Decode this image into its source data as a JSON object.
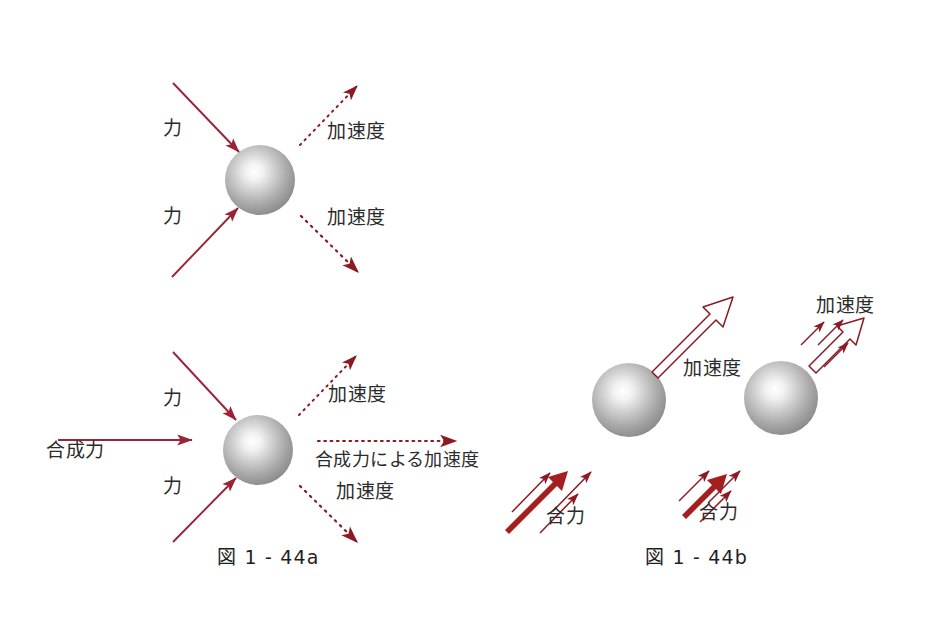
{
  "document": {
    "title": "図 1 - 44 力と加速度",
    "background_color": "#ffffff",
    "accent_color": "#8b1a22",
    "force_arrow_color": "#9b2335",
    "accel_arrow_color": "#8b1a22",
    "sphere_color": "#9a9a9a",
    "text_color": "#2b2b2b"
  },
  "figures": [
    {
      "id": "fig-1-44a-top",
      "caption": "",
      "labels": {
        "force_upper": "力",
        "force_lower": "力",
        "accel_upper": "加速度",
        "accel_lower": "加速度"
      }
    },
    {
      "id": "fig-1-44a-bottom",
      "caption": "図 1 - 44a",
      "labels": {
        "force_upper": "力",
        "force_lower": "力",
        "resultant_force": "合成力",
        "accel_upper": "加速度",
        "accel_resultant": "合成力による加速度",
        "accel_lower": "加速度"
      }
    },
    {
      "id": "fig-1-44b",
      "caption": "図 1 - 44b",
      "labels": {
        "resultant_force_left": "合力",
        "resultant_force_right": "合力",
        "accel_left": "加速度",
        "accel_right": "加速度"
      }
    }
  ],
  "captions": {
    "left": "図 1 - 44a",
    "right": "図 1 - 44b"
  },
  "text": {
    "chikara": "力",
    "kasokudo": "加速度",
    "goseiryoku": "合成力",
    "goseiryoku_ni_yoru_kasokudo": "合成力による加速度",
    "goryoku": "合力"
  }
}
